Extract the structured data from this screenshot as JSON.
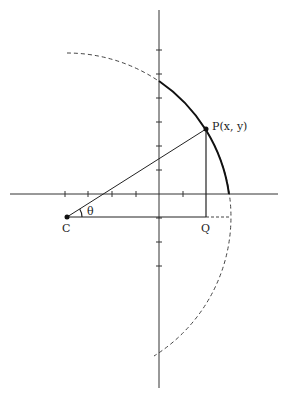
{
  "diagram": {
    "labels": {
      "point_p": "P(x, y)",
      "point_c": "C",
      "point_q": "Q",
      "angle": "θ"
    },
    "geometry": {
      "origin": [
        159,
        194
      ],
      "center_c": [
        67,
        217
      ],
      "point_p": [
        206,
        129
      ],
      "point_q": [
        206,
        217
      ],
      "radius": 164,
      "tick_spacing": 24
    }
  }
}
